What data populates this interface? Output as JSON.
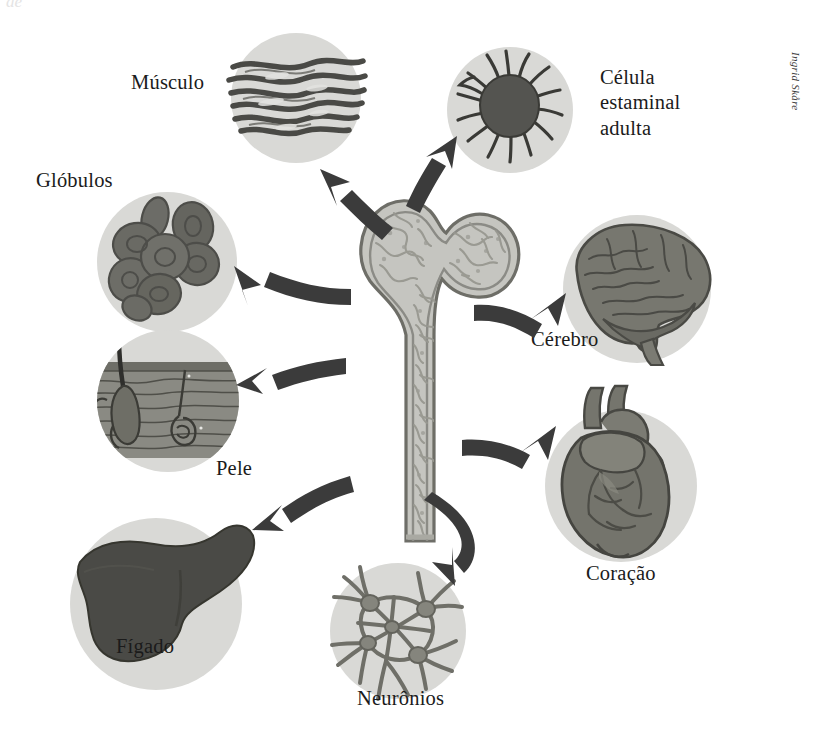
{
  "figure": {
    "type": "diagram",
    "background_color": "#ffffff",
    "disc_color": "#d9d9d6",
    "ink_color": "#3b3b3b",
    "text_color": "#1b1b1b",
    "credit": "Ingrid Skåre",
    "ghost_text": "de"
  },
  "center": {
    "name": "bone",
    "description": "femur-bone-marrow",
    "fill": "#c2c2bd",
    "texture": "#9a9a95",
    "outline": "#6e6e69"
  },
  "nodes": [
    {
      "id": "musculo",
      "label": "Músculo",
      "icon": "muscle-fibers-icon",
      "label_x": 131,
      "label_y": 70,
      "disc_x": 231,
      "disc_y": 33,
      "disc_d": 130
    },
    {
      "id": "celula-estaminal-adulta",
      "label": "Célula\nestaminal\nadulta",
      "icon": "stem-cell-icon",
      "label_x": 600,
      "label_y": 65,
      "disc_x": 447,
      "disc_y": 47,
      "disc_d": 126
    },
    {
      "id": "globulos",
      "label": "Glóbulos",
      "icon": "red-blood-cells-icon",
      "label_x": 36,
      "label_y": 168,
      "disc_x": 97,
      "disc_y": 192,
      "disc_d": 140
    },
    {
      "id": "cerebro",
      "label": "Cérebro",
      "icon": "brain-icon",
      "label_x": 531,
      "label_y": 327,
      "disc_x": 563,
      "disc_y": 215,
      "disc_d": 148
    },
    {
      "id": "pele",
      "label": "Pele",
      "icon": "skin-cross-section-icon",
      "label_x": 216,
      "label_y": 456,
      "disc_x": 97,
      "disc_y": 330,
      "disc_d": 142
    },
    {
      "id": "coracao",
      "label": "Coração",
      "icon": "heart-icon",
      "label_x": 586,
      "label_y": 561,
      "disc_x": 545,
      "disc_y": 410,
      "disc_d": 152
    },
    {
      "id": "figado",
      "label": "Fígado",
      "icon": "liver-icon",
      "label_x": 116,
      "label_y": 634,
      "disc_x": 70,
      "disc_y": 518,
      "disc_d": 172
    },
    {
      "id": "neuronios",
      "label": "Neurônios",
      "icon": "neurons-icon",
      "label_x": 357,
      "label_y": 686,
      "disc_x": 330,
      "disc_y": 563,
      "disc_d": 136
    }
  ],
  "arrows": [
    {
      "from": "bone",
      "to": "musculo",
      "name": "arrow-to-musculo",
      "direction": "up-left"
    },
    {
      "from": "bone",
      "to": "celula-estaminal-adulta",
      "name": "arrow-to-stem-cell",
      "direction": "up-right"
    },
    {
      "from": "bone",
      "to": "globulos",
      "name": "arrow-to-globulos",
      "direction": "left"
    },
    {
      "from": "bone",
      "to": "cerebro",
      "name": "arrow-to-cerebro",
      "direction": "right"
    },
    {
      "from": "bone",
      "to": "pele",
      "name": "arrow-to-pele",
      "direction": "down-left"
    },
    {
      "from": "bone",
      "to": "coracao",
      "name": "arrow-to-coracao",
      "direction": "down-right"
    },
    {
      "from": "bone",
      "to": "figado",
      "name": "arrow-to-figado",
      "direction": "down-left"
    },
    {
      "from": "bone",
      "to": "neuronios",
      "name": "arrow-to-neuronios",
      "direction": "down-curved"
    }
  ]
}
